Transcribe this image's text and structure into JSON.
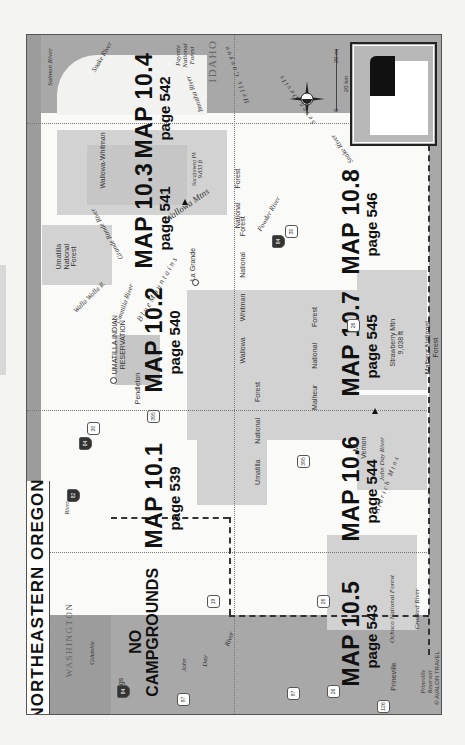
{
  "title": "NORTHEASTERN OREGON",
  "maps": [
    {
      "id": "10.1",
      "label": "MAP 10.1",
      "page": "page 539"
    },
    {
      "id": "10.2",
      "label": "MAP 10.2",
      "page": "page 540"
    },
    {
      "id": "10.3",
      "label": "MAP 10.3",
      "page": "page 541"
    },
    {
      "id": "10.4",
      "label": "MAP 10.4",
      "page": "page 542"
    },
    {
      "id": "10.5",
      "label": "MAP 10.5",
      "page": "page 543"
    },
    {
      "id": "10.6",
      "label": "MAP 10.6",
      "page": "page 544"
    },
    {
      "id": "10.7",
      "label": "MAP 10.7",
      "page": "page 545"
    },
    {
      "id": "10.8",
      "label": "MAP 10.8",
      "page": "page 546"
    }
  ],
  "no_campgrounds": {
    "line1": "NO",
    "line2": "CAMPGROUNDS"
  },
  "states": {
    "washington": "WASHINGTON",
    "idaho": "IDAHO"
  },
  "places": {
    "pendleton": "Pendleton",
    "la_grande": "La Grande",
    "biggs": "Biggs",
    "prineville": "Prineville",
    "mt_vernon_1": "Mt",
    "mt_vernon_2": "Vernon",
    "reservation_1": "UMATILLA INDIAN",
    "reservation_2": "RESERVATION"
  },
  "rivers": {
    "salmon": "Salmon River",
    "snake_n": "Snake River",
    "snake_s": "Snake River",
    "imnaha": "Imnaha River",
    "grande_ronde": "Grande Ronde River",
    "walla_walla": "Walla Walla R.",
    "umatilla": "Umatilla River",
    "powder": "Powder River",
    "john_day_n_1": "John",
    "john_day_n_2": "Day",
    "john_day_n_3": "River",
    "john_day_s": "John Day River",
    "columbia": "Columbia",
    "columbia_river": "River",
    "crooked": "Crooked River"
  },
  "features": {
    "hells_canyon": "Hells Canyon",
    "seven_devils": "Seven Devils",
    "wallowa_mtns": "Wallowa Mtns",
    "sacajawea_1": "Sacajawea Pk",
    "sacajawea_2": "9,833 ft",
    "strawberry_1": "Strawberry Mtn",
    "strawberry_2": "9,038 ft",
    "aldrich_mtns": "Aldrich Mtns",
    "blue_mtns": "B l u e   M o u n t a i n s",
    "prineville_res_1": "Prineville",
    "prineville_res_2": "Reservoir"
  },
  "forests": {
    "payette_1": "Payette",
    "payette_2": "National",
    "payette_3": "Forest",
    "wallowa_whitman_n": "Wallowa-Whitman",
    "wallowa_nf_1": "National",
    "wallowa_nf_2": "Forest",
    "umatilla_nf_1": "Umatilla",
    "umatilla_nf_2": "National",
    "umatilla_nf_3": "Forest",
    "ww_mid_1": "Wallowa",
    "ww_mid_2": "Whitman",
    "ww_mid_3": "National",
    "ww_mid_4": "Forest",
    "umatilla_s_1": "Umatilla",
    "umatilla_s_2": "National",
    "umatilla_s_3": "Forest",
    "malheur_1": "Malheur",
    "malheur_2": "National",
    "malheur_3": "Forest",
    "malheur_s_1": "Malheur National",
    "malheur_s_2": "Forest",
    "ochoco": "Ochoco National Forest"
  },
  "highways": {
    "i84_a": "84",
    "us30_a": "30",
    "i84_b": "84",
    "us30_b": "30",
    "i84_c": "84",
    "us395_a": "395",
    "us395_b": "395",
    "or82": "82",
    "us26_a": "26",
    "us26_b": "26",
    "us26_c": "26",
    "or19": "19",
    "us97_a": "97",
    "us97_b": "97",
    "us97_c": "97",
    "or126": "126"
  },
  "scale": {
    "miles": "20 mi",
    "km": "20 km",
    "zero_a": "0",
    "zero_b": "0"
  },
  "copyright": "© AVALON TRAVEL",
  "colors": {
    "water": "#9c9c9c",
    "forest": "#d2d2d2",
    "land": "#fafaf8",
    "highlight": "#111111"
  }
}
